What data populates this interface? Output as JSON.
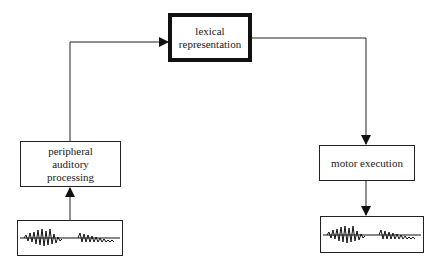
{
  "diagram": {
    "nodes": {
      "lexical": {
        "label": "lexical\nrepresentation",
        "emphasis": "bold"
      },
      "peripheral": {
        "label": "peripheral\nauditory\nprocessing"
      },
      "motor": {
        "label": "motor execution"
      },
      "input_wave": {
        "type": "speech-waveform"
      },
      "output_wave": {
        "type": "speech-waveform"
      }
    },
    "edges": [
      {
        "from": "input_wave",
        "to": "peripheral"
      },
      {
        "from": "peripheral",
        "to": "lexical"
      },
      {
        "from": "lexical",
        "to": "motor"
      },
      {
        "from": "motor",
        "to": "output_wave"
      }
    ]
  }
}
